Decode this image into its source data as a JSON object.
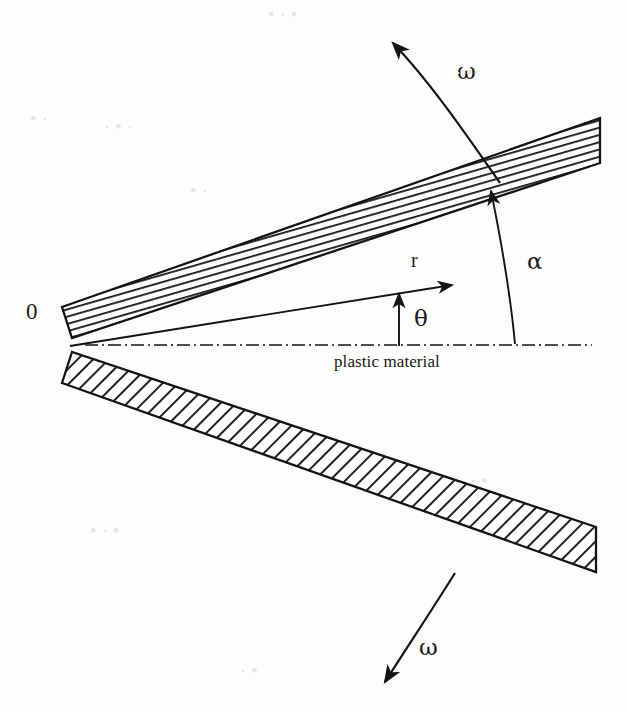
{
  "figure": {
    "kind": "engineering-diagram",
    "background_color": "#fdfdfc",
    "ink_color": "#1a1a1a"
  },
  "labels": {
    "origin": "0",
    "radius": "r",
    "theta": "θ",
    "alpha": "α",
    "omega_top": "ω",
    "omega_bottom": "ω",
    "plastic_material": "plastic material"
  },
  "geometry": {
    "vertex": {
      "x": 68,
      "y": 345
    },
    "upper_die": {
      "half_angle_deg": 23,
      "inner_edge_from": {
        "x": 72,
        "y": 338
      },
      "inner_edge_to": {
        "x": 600,
        "y": 163
      },
      "outer_edge_from": {
        "x": 62,
        "y": 307
      },
      "outer_edge_to": {
        "x": 600,
        "y": 118
      },
      "hatch_angle_deg": 74,
      "hatch_spacing_px": 7
    },
    "lower_die": {
      "half_angle_deg": 23,
      "inner_edge_from": {
        "x": 72,
        "y": 352
      },
      "inner_edge_to": {
        "x": 596,
        "y": 527
      },
      "outer_edge_from": {
        "x": 62,
        "y": 383
      },
      "outer_edge_to": {
        "x": 596,
        "y": 572
      },
      "hatch_angle_deg": 45,
      "hatch_spacing_px": 11
    },
    "centerline": {
      "from": {
        "x": 85,
        "y": 345
      },
      "to": {
        "x": 592,
        "y": 345
      }
    },
    "r_vector": {
      "from": {
        "x": 70,
        "y": 346
      },
      "to": {
        "x": 455,
        "y": 284
      }
    },
    "theta_arrow": {
      "from": {
        "x": 399,
        "y": 345
      },
      "to": {
        "x": 399,
        "y": 291
      }
    },
    "alpha_arc": {
      "from": {
        "x": 515,
        "y": 344
      },
      "to": {
        "x": 490,
        "y": 187
      }
    },
    "omega_top_arc": {
      "from": {
        "x": 500,
        "y": 183
      },
      "to": {
        "x": 389,
        "y": 37
      }
    },
    "omega_bottom_arc": {
      "from": {
        "x": 455,
        "y": 573
      },
      "to": {
        "x": 380,
        "y": 687
      }
    }
  },
  "artifacts": [
    {
      "text": "•  · •",
      "x": 268,
      "y": 4
    },
    {
      "text": "· •·",
      "x": 455,
      "y": 62
    },
    {
      "text": "•  ·",
      "x": 30,
      "y": 108
    },
    {
      "text": "· • ·",
      "x": 104,
      "y": 116
    },
    {
      "text": "• ·",
      "x": 190,
      "y": 180
    },
    {
      "text": "· •",
      "x": 470,
      "y": 470
    },
    {
      "text": "• · •",
      "x": 90,
      "y": 520
    },
    {
      "text": "· •",
      "x": 240,
      "y": 660
    }
  ]
}
